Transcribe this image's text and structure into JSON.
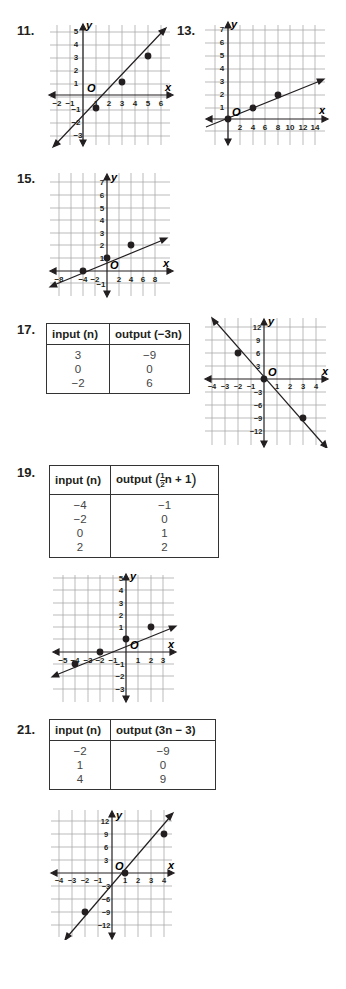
{
  "exercises": [
    {
      "number": "11.",
      "graph": {
        "x_ticks": [
          "−2",
          "−1",
          "1",
          "2",
          "3",
          "4",
          "5",
          "6"
        ],
        "y_ticks": [
          "5",
          "4",
          "3",
          "2",
          "1",
          "−1",
          "−2",
          "−3"
        ],
        "points": [
          [
            1,
            -1
          ],
          [
            3,
            1
          ],
          [
            5,
            3
          ]
        ],
        "line": "y = x − 2"
      }
    },
    {
      "number": "13.",
      "graph": {
        "x_ticks": [
          "2",
          "4",
          "6",
          "8",
          "10",
          "12",
          "14"
        ],
        "y_ticks": [
          "7",
          "6",
          "5",
          "4",
          "3",
          "2",
          "1"
        ],
        "points": [
          [
            0,
            0
          ],
          [
            4,
            1
          ],
          [
            8,
            2
          ]
        ],
        "line": "y = x/4"
      }
    },
    {
      "number": "15.",
      "graph": {
        "x_ticks": [
          "−8",
          "−4",
          "−2",
          "2",
          "4",
          "6",
          "8"
        ],
        "y_ticks": [
          "7",
          "6",
          "5",
          "4",
          "3",
          "2",
          "1",
          "−1"
        ],
        "points": [
          [
            -4,
            0
          ],
          [
            0,
            1
          ],
          [
            4,
            2
          ]
        ],
        "line": "y = x/4 + 1"
      }
    },
    {
      "number": "17.",
      "table": {
        "headers": [
          "input (n)",
          "output (−3n)"
        ],
        "rows": [
          [
            "3",
            "−9"
          ],
          [
            "0",
            "0"
          ],
          [
            "−2",
            "6"
          ]
        ]
      },
      "graph": {
        "x_ticks": [
          "−4",
          "−3",
          "−2",
          "−1",
          "1",
          "2",
          "3",
          "4"
        ],
        "y_ticks": [
          "12",
          "9",
          "6",
          "3",
          "−3",
          "−6",
          "−9",
          "−12"
        ],
        "points": [
          [
            -2,
            6
          ],
          [
            0,
            0
          ],
          [
            3,
            -9
          ]
        ],
        "line": "y = −3x"
      }
    },
    {
      "number": "19.",
      "table": {
        "headers": [
          "input (n)",
          "output"
        ],
        "header_expr": {
          "frac_num": "1",
          "frac_den": "2",
          "rest": "n + 1"
        },
        "rows": [
          [
            "−4",
            "−1"
          ],
          [
            "−2",
            "0"
          ],
          [
            "0",
            "1"
          ],
          [
            "2",
            "2"
          ]
        ]
      },
      "graph": {
        "x_ticks": [
          "−5",
          "−4",
          "−3",
          "−2",
          "−1",
          "1",
          "2",
          "3"
        ],
        "y_ticks": [
          "5",
          "4",
          "3",
          "2",
          "1",
          "−1",
          "−2",
          "−3"
        ],
        "points": [
          [
            -4,
            -1
          ],
          [
            -2,
            0
          ],
          [
            0,
            1
          ],
          [
            2,
            2
          ]
        ],
        "line": "y = x/2 + 1"
      }
    },
    {
      "number": "21.",
      "table": {
        "headers": [
          "input (n)",
          "output (3n − 3)"
        ],
        "rows": [
          [
            "−2",
            "−9"
          ],
          [
            "1",
            "0"
          ],
          [
            "4",
            "9"
          ]
        ]
      },
      "graph": {
        "x_ticks": [
          "−4",
          "−3",
          "−2",
          "−1",
          "1",
          "2",
          "3",
          "4"
        ],
        "y_ticks": [
          "12",
          "9",
          "6",
          "3",
          "−3",
          "−6",
          "−9",
          "−12"
        ],
        "points": [
          [
            -2,
            -9
          ],
          [
            1,
            0
          ],
          [
            4,
            9
          ]
        ],
        "line": "y = 3x − 3"
      }
    }
  ],
  "axis_labels": {
    "x": "x",
    "y": "y",
    "origin": "O"
  }
}
